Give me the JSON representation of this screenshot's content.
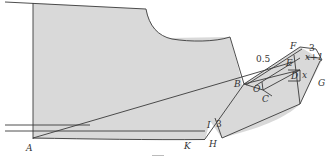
{
  "colors": {
    "fill": "#d9d9d9",
    "line": "#3a3a3a",
    "label": "#333333",
    "background": "#ffffff"
  },
  "points": {
    "A": "A",
    "B": "B",
    "C": "C",
    "D": "D",
    "E": "E",
    "F": "F",
    "G": "G",
    "H": "H",
    "I": "I",
    "K": "K",
    "O": "O"
  },
  "measurements": {
    "dart_offset": "0.5",
    "top_width": "3",
    "side_x_plus_1": "x+1",
    "side_x": "x",
    "ih_length": "3"
  }
}
